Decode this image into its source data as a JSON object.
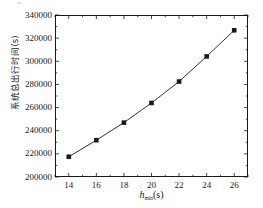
{
  "figure": {
    "background_color": "#ffffff",
    "foreground_color": "#1a1a1a",
    "top_artifact_text": "in"
  },
  "axes": {
    "x_title_var": "h",
    "x_title_sub": "min",
    "x_title_unit": "(s)",
    "x_title_full": "h_min(s)",
    "y_title": "系统总出行时间(s)",
    "x_ticks": [
      "14",
      "16",
      "18",
      "20",
      "22",
      "24",
      "26"
    ],
    "y_ticks": [
      "200000",
      "220000",
      "240000",
      "260000",
      "280000",
      "300000",
      "320000",
      "340000"
    ]
  },
  "chart_data": {
    "type": "line",
    "title": "",
    "subtitle": "",
    "xlabel": "h_min(s)",
    "ylabel": "系统总出行时间(s)",
    "xlim": [
      13,
      27
    ],
    "ylim": [
      200000,
      340000
    ],
    "x_tick_values": [
      14,
      16,
      18,
      20,
      22,
      24,
      26
    ],
    "y_tick_values": [
      200000,
      220000,
      240000,
      260000,
      280000,
      300000,
      320000,
      340000
    ],
    "x_minor_ticks": true,
    "y_minor_ticks": true,
    "grid": false,
    "legend": null,
    "marker": "filled-square",
    "marker_color": "#1a1a1a",
    "line_color": "#1a1a1a",
    "series": [
      {
        "name": "系统总出行时间",
        "x": [
          14,
          16,
          18,
          20,
          22,
          24,
          26
        ],
        "values": [
          217500,
          231800,
          247000,
          264000,
          282500,
          304200,
          326800
        ]
      }
    ]
  }
}
